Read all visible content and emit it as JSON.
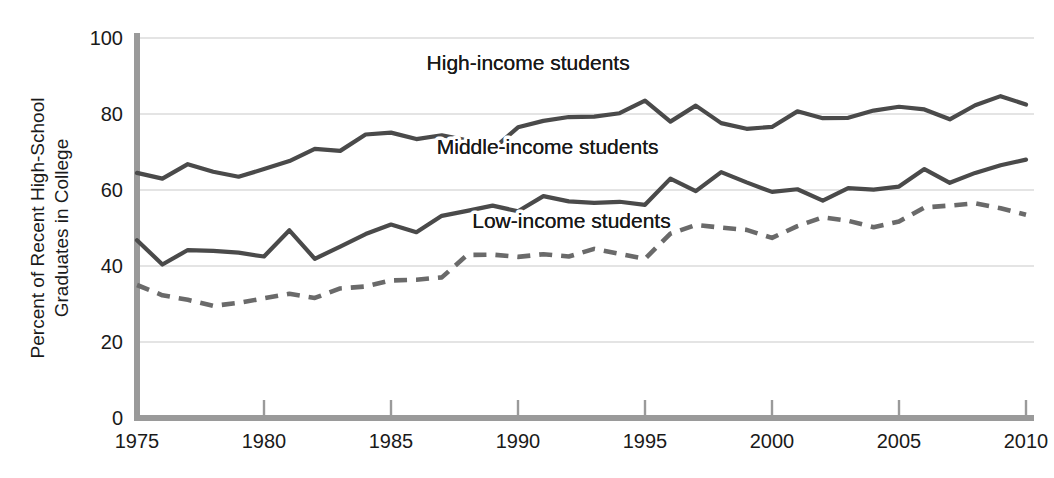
{
  "chart_data": {
    "type": "line",
    "title": "",
    "xlabel": "",
    "ylabel": "Percent of Recent High-School Graduates in College",
    "ylabel_line1": "Percent of Recent High-School",
    "ylabel_line2": "Graduates in College",
    "xlim": [
      1975,
      2010
    ],
    "ylim": [
      0,
      100
    ],
    "grid": true,
    "legend_position": "inline-annotations",
    "y_ticks": [
      "0",
      "20",
      "40",
      "60",
      "80",
      "100"
    ],
    "y_tick_values": [
      0,
      20,
      40,
      60,
      80,
      100
    ],
    "x_ticks": [
      "1975",
      "1980",
      "1985",
      "1990",
      "1995",
      "2000",
      "2005",
      "2010"
    ],
    "x_tick_values": [
      1975,
      1980,
      1985,
      1990,
      1995,
      2000,
      2005,
      2010
    ],
    "x": [
      1975,
      1976,
      1977,
      1978,
      1979,
      1980,
      1981,
      1982,
      1983,
      1984,
      1985,
      1986,
      1987,
      1988,
      1989,
      1990,
      1991,
      1992,
      1993,
      1994,
      1995,
      1996,
      1997,
      1998,
      1999,
      2000,
      2001,
      2002,
      2003,
      2004,
      2005,
      2006,
      2007,
      2008,
      2009,
      2010
    ],
    "series": [
      {
        "name": "High-income students",
        "style": "solid",
        "color": "#4a4a4a",
        "label_x": 1986.4,
        "label_y": 91.5,
        "values": [
          64.5,
          63.0,
          66.8,
          64.8,
          63.5,
          65.5,
          67.6,
          70.8,
          70.3,
          74.6,
          75.1,
          73.4,
          74.4,
          73.1,
          70.7,
          76.5,
          78.2,
          79.2,
          79.3,
          80.2,
          83.5,
          78.0,
          82.2,
          77.6,
          76.1,
          76.6,
          80.7,
          78.9,
          79.0,
          80.9,
          81.9,
          81.2,
          78.6,
          82.3,
          84.7,
          82.5
        ]
      },
      {
        "name": "Middle-income students",
        "style": "solid",
        "color": "#4a4a4a",
        "label_x": 1986.8,
        "label_y": 69.5,
        "values": [
          46.8,
          40.4,
          44.2,
          44.0,
          43.5,
          42.5,
          49.4,
          41.9,
          45.1,
          48.4,
          50.9,
          48.9,
          53.2,
          54.5,
          55.9,
          54.4,
          58.4,
          57.0,
          56.6,
          56.9,
          56.1,
          63.0,
          59.7,
          64.7,
          62.0,
          59.5,
          60.2,
          57.2,
          60.5,
          60.1,
          60.9,
          65.5,
          61.9,
          64.5,
          66.5,
          68.0
        ]
      },
      {
        "name": "Low-income students",
        "style": "dashed",
        "color": "#6a6a6a",
        "label_x": 1988.2,
        "label_y": 50.0,
        "values": [
          35.0,
          32.3,
          31.1,
          29.5,
          30.3,
          31.5,
          32.7,
          31.6,
          34.1,
          34.6,
          36.2,
          36.4,
          37.0,
          42.9,
          43.0,
          42.4,
          43.1,
          42.5,
          44.5,
          43.2,
          41.9,
          48.5,
          50.8,
          50.1,
          49.5,
          47.4,
          50.5,
          52.8,
          51.9,
          50.2,
          51.7,
          55.4,
          55.9,
          56.5,
          55.2,
          53.5
        ]
      }
    ]
  }
}
